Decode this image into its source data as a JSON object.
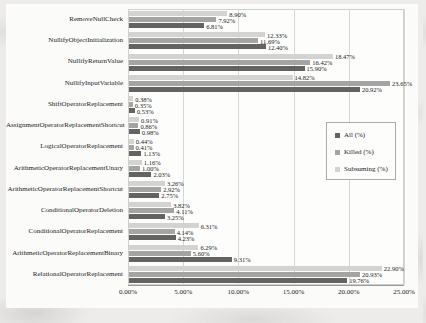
{
  "chart_data": {
    "type": "bar",
    "orientation": "horizontal",
    "title": "",
    "categories": [
      "RemoveNullCheck",
      "NullifyObjectInitialization",
      "NullifyReturnValue",
      "NullifyInputVariable",
      "ShiftOperatorReplacement",
      "AssignmentOperatorReplacementShortcut",
      "LogicalOperatorReplacement",
      "ArithmeticOperatorReplacementUnary",
      "ArithmeticOperatorReplacementShortcut",
      "ConditionalOperatorDeletion",
      "ConditionalOperatorReplacement",
      "ArithmeticOperatorReplacementBinary",
      "RelationalOperatorReplacement"
    ],
    "series": [
      {
        "name": "All (%)",
        "color": "#636361",
        "values": [
          6.81,
          12.4,
          15.9,
          20.92,
          0.53,
          0.98,
          1.13,
          2.03,
          2.75,
          3.25,
          4.23,
          9.31,
          19.76
        ]
      },
      {
        "name": "Killed (%)",
        "color": "#a4a4a2",
        "values": [
          7.92,
          11.69,
          16.42,
          23.65,
          0.35,
          0.86,
          0.41,
          1.0,
          2.92,
          4.11,
          4.14,
          5.6,
          20.93
        ]
      },
      {
        "name": "Subsuming (%)",
        "color": "#d3d3d1",
        "values": [
          8.9,
          12.33,
          18.47,
          14.82,
          0.38,
          0.91,
          0.44,
          1.16,
          3.26,
          3.82,
          6.31,
          6.29,
          22.9
        ]
      }
    ],
    "series_display_order_top_to_bottom": [
      "Subsuming (%)",
      "Killed (%)",
      "All (%)"
    ],
    "x_ticks": [
      "0.00%",
      "5.00%",
      "10.00%",
      "15.00%",
      "20.00%",
      "25.00%"
    ],
    "xlim": [
      0,
      25
    ],
    "grid": "vertical",
    "legend_position": "middle-right",
    "value_label_format": "0.00%"
  }
}
